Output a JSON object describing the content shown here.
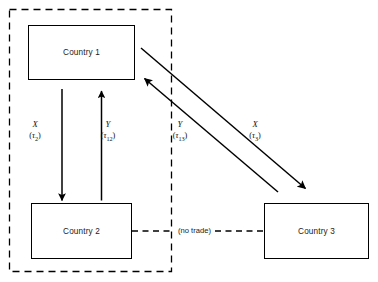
{
  "diagram": {
    "type": "node-link-diagram",
    "background_color": "#ffffff",
    "line_color": "#000000"
  },
  "nodes": [
    {
      "id": "country1",
      "label": "Country 1",
      "x": 28,
      "y": 25,
      "w": 107,
      "h": 55
    },
    {
      "id": "country2",
      "label": "Country 2",
      "x": 31,
      "y": 203,
      "w": 101,
      "h": 56
    },
    {
      "id": "country3",
      "label": "Country 3",
      "x": 264,
      "y": 203,
      "w": 105,
      "h": 56
    }
  ],
  "region": {
    "name": "customs-union-boundary",
    "style": "dashed",
    "x": 9,
    "y": 9,
    "w": 163,
    "h": 263
  },
  "flows": [
    {
      "id": "flow-x-tau2",
      "good": "X",
      "tariff_prefix": "(",
      "tariff_symbol": "τ",
      "tariff_subscript": "2",
      "tariff_suffix": ")",
      "tariff_text": "(τ₂)",
      "from": "country1",
      "to": "country2",
      "direction": "down",
      "label_x": 32,
      "label_y": 122
    },
    {
      "id": "flow-y-tau12",
      "good": "Y",
      "tariff_prefix": "(",
      "tariff_symbol": "τ",
      "tariff_subscript": "12",
      "tariff_suffix": ")",
      "tariff_text": "(τ₁₂)",
      "from": "country2",
      "to": "country1",
      "direction": "up",
      "label_x": 103,
      "label_y": 122
    },
    {
      "id": "flow-y-tau13",
      "good": "Y",
      "tariff_prefix": "(",
      "tariff_symbol": "τ",
      "tariff_subscript": "13",
      "tariff_suffix": ")",
      "tariff_text": "(τ₁₃)",
      "from": "country3",
      "to": "country1",
      "direction": "up-left",
      "label_x": 175,
      "label_y": 122
    },
    {
      "id": "flow-x-tau3",
      "good": "X",
      "tariff_prefix": "(",
      "tariff_symbol": "τ",
      "tariff_subscript": "3",
      "tariff_suffix": ")",
      "tariff_text": "(τ₃)",
      "from": "country1",
      "to": "country3",
      "direction": "down-right",
      "label_x": 252,
      "label_y": 122
    }
  ],
  "connectors": [
    {
      "id": "no-trade-connector",
      "label": "(no trade)",
      "style": "dashed",
      "from": "country2",
      "to": "country3",
      "label_x": 179,
      "label_y": 226
    }
  ]
}
